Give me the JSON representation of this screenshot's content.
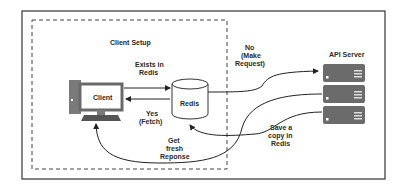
{
  "diagram": {
    "client_setup_label": "Client Setup",
    "client_label": "Client",
    "redis_label": "Redis",
    "api_server_label": "API Server",
    "edges": {
      "exists_line1": "Exists in",
      "exists_line2": "Redis",
      "yes_line1": "Yes",
      "yes_line2": "(Fetch)",
      "no_line1": "No",
      "no_line2": "(Make",
      "no_line3": "Request)",
      "get_line1": "Get",
      "get_line2": "fresh",
      "get_line3": "Reponse",
      "save_line1": "Save a",
      "save_line2": "copy in",
      "save_line3": "Redis"
    },
    "colors": {
      "server_fill": "#6b6b6b",
      "computer_fill": "#7a7a7a",
      "line": "#222222"
    }
  }
}
